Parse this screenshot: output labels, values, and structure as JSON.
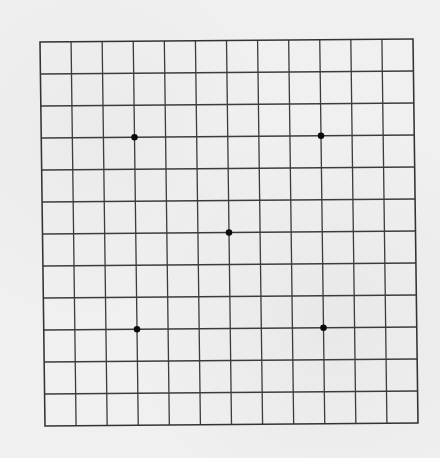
{
  "board": {
    "type": "go-board",
    "size": 13,
    "line_color": "#3c3c3c",
    "background_color": "#f0f0f0",
    "star_color": "#0a0a0a",
    "corners_px": {
      "top_left": [
        40,
        42
      ],
      "top_right": [
        413,
        39
      ],
      "bottom_left": [
        45,
        426
      ],
      "bottom_right": [
        418,
        422
      ]
    },
    "star_points": [
      {
        "col": 3,
        "row": 3
      },
      {
        "col": 9,
        "row": 3
      },
      {
        "col": 6,
        "row": 6
      },
      {
        "col": 3,
        "row": 9
      },
      {
        "col": 9,
        "row": 9
      }
    ],
    "stones": []
  }
}
